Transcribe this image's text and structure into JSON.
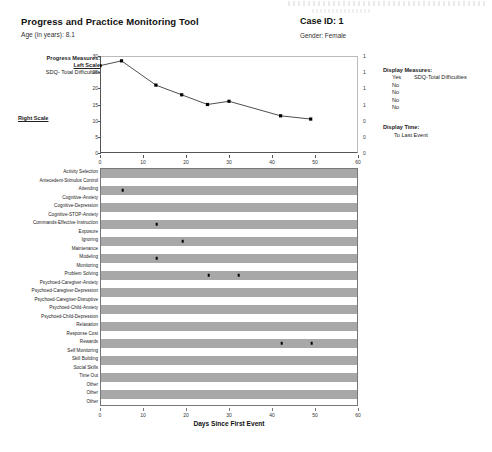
{
  "header": {
    "title": "Progress and Practice Monitoring Tool",
    "age_label": "Age (in years): 8.1",
    "case_id": "Case ID: 1",
    "gender": "Gender: Female"
  },
  "progress_measures": {
    "title": "Progress Measures:",
    "left_scale_label": "Left Scale",
    "left_measure": "SDQ- Total Difficulties",
    "right_scale_label": "Right Scale"
  },
  "display_measures": {
    "title": "Display Measures:",
    "rows": [
      {
        "value": "Yes",
        "name": "SDQ-Total Difficulties"
      },
      {
        "value": "No",
        "name": ""
      },
      {
        "value": "No",
        "name": ""
      },
      {
        "value": "No",
        "name": ""
      },
      {
        "value": "No",
        "name": ""
      }
    ],
    "time_title": "Display Time:",
    "time_value": "To Last Event"
  },
  "chart_data": [
    {
      "type": "line",
      "title": "",
      "xlabel": "",
      "ylabel": "",
      "xlim": [
        0,
        60
      ],
      "ylim": [
        0,
        30
      ],
      "y2lim": [
        0,
        1
      ],
      "grid": false,
      "legend": "left",
      "xticks": [
        0,
        10,
        20,
        30,
        40,
        50,
        60
      ],
      "yticks": [
        0,
        5,
        10,
        15,
        20,
        25,
        30
      ],
      "y2ticks": [
        "0",
        "0",
        "0",
        "1",
        "1",
        "1",
        "1"
      ],
      "series": [
        {
          "name": "SDQ- Total Difficulties",
          "x": [
            0,
            5,
            13,
            19,
            25,
            30,
            42,
            49
          ],
          "values": [
            27,
            28.5,
            21,
            18,
            15,
            16,
            11.5,
            10.5
          ]
        }
      ]
    },
    {
      "type": "scatter",
      "title": "",
      "xlabel": "Days Since First Event",
      "ylabel": "",
      "xlim": [
        0,
        60
      ],
      "grid": false,
      "xticks": [
        0,
        10,
        20,
        30,
        40,
        50,
        60
      ],
      "categories": [
        "Activity Selection",
        "Antecedent-Stimulus Control",
        "Attending",
        "Cognitive-Anxiety",
        "Cognitive-Depression",
        "Cognitive-STOP-Anxiety",
        "Commands-Effective Instruction",
        "Exposure",
        "Ignoring",
        "Maintenance",
        "Modeling",
        "Monitoring",
        "Problem Solving",
        "Psychoed-Caregiver-Anxiety",
        "Psychoed-Caregiver-Depression",
        "Psychoed-Caregiver-Disruptive",
        "Psychoed-Child-Anxiety",
        "Psychoed-Child-Depression",
        "Relaxation",
        "Response Cost",
        "Rewards",
        "Self Monitoring",
        "Skill Building",
        "Social Skills",
        "Time Out",
        "Other",
        "Other",
        "Other"
      ],
      "points": [
        {
          "category": "Attending",
          "x": 5
        },
        {
          "category": "Commands-Effective Instruction",
          "x": 13
        },
        {
          "category": "Ignoring",
          "x": 19
        },
        {
          "category": "Modeling",
          "x": 13
        },
        {
          "category": "Problem Solving",
          "x": 25
        },
        {
          "category": "Problem Solving",
          "x": 32
        },
        {
          "category": "Rewards",
          "x": 42
        },
        {
          "category": "Rewards",
          "x": 49
        }
      ]
    }
  ],
  "colors": {
    "shade_row": "#a8a8a8",
    "marker": "#000000",
    "line": "#3a3a3a",
    "axis": "#555555"
  }
}
